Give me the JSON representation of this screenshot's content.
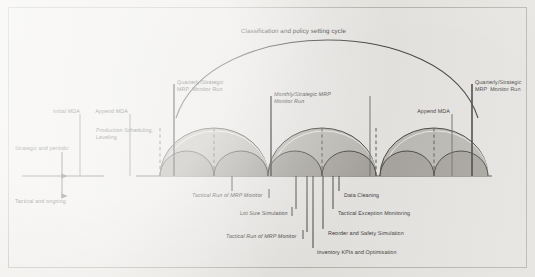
{
  "diagram": {
    "cycle_arc_label": "Classification and policy setting cycle",
    "axis": {
      "top_label": "Strategic and periodic",
      "bottom_label": "Tactical and ongoing"
    },
    "milestones": [
      {
        "name": "initial-mda",
        "label": "Initial MDA",
        "x": 58,
        "y": 112
      },
      {
        "name": "append-mda-1",
        "label": "Append MDA",
        "x": 102,
        "y": 112
      },
      {
        "name": "production-scheduling",
        "label": "Production Scheduling,\nLeveling",
        "x": 97,
        "y": 131
      },
      {
        "name": "quarterly-mrp-left",
        "label": "Quarterly/Strategic\nMRP  Monitor Run",
        "x": 177,
        "y": 80
      },
      {
        "name": "monthly-mrp",
        "label": "Monthly/Strategic MRP\nMonitor Run",
        "x": 274,
        "y": 92
      },
      {
        "name": "append-mda-2",
        "label": "Append MDA",
        "x": 424,
        "y": 112
      },
      {
        "name": "quarterly-mrp-right",
        "label": "Quarterly/Strategic\nMRP  Monitor Run",
        "x": 474,
        "y": 80
      }
    ],
    "callouts": [
      {
        "name": "tactical-run-mrp-monitor-1",
        "label": "Tactical Run of MRP Monitor",
        "tick_x": 232,
        "text_x": 192,
        "text_y": 195,
        "align": "left"
      },
      {
        "name": "data-cleaning",
        "label": "Data Cleaning",
        "tick_x": 339,
        "text_x": 344,
        "text_y": 195,
        "align": "left"
      },
      {
        "name": "lot-size-simulation",
        "label": "Lot Size Simulation",
        "tick_x": 296,
        "text_x": 240,
        "text_y": 213,
        "align": "left"
      },
      {
        "name": "tactical-exception-monitoring",
        "label": "Tactical Exception Monitoring",
        "tick_x": 333,
        "text_x": 338,
        "text_y": 213,
        "align": "left"
      },
      {
        "name": "reorder-safety-simulation",
        "label": "Reorder and Safety Simulation",
        "tick_x": 323,
        "text_x": 328,
        "text_y": 233,
        "align": "left"
      },
      {
        "name": "tactical-run-mrp-monitor-2",
        "label": "Tactical Run of MRP Monitor",
        "tick_x": 307,
        "text_x": 226,
        "text_y": 236,
        "align": "left"
      },
      {
        "name": "inventory-kpis-optimisation",
        "label": "Inventory KPIs and Optimisation",
        "tick_x": 313,
        "text_x": 317,
        "text_y": 252,
        "align": "left"
      }
    ],
    "colors": {
      "ink": "#32302e",
      "line": "#4a4845",
      "arch_outer_fill": "#b9b6b0",
      "arch_inner_fill": "#a4a19b",
      "paper": "#eceae6",
      "frame": "#b9b5ae"
    }
  }
}
